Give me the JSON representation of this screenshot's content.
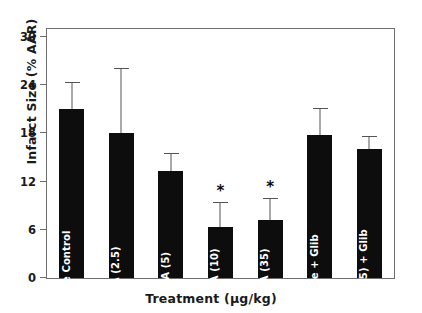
{
  "chart_data": {
    "type": "bar",
    "title": "",
    "xlabel": "Treatment (µg/kg)",
    "ylabel": "Infarct Size (% AAR)",
    "ylim": [
      0,
      31
    ],
    "yticks": [
      0,
      6,
      12,
      18,
      24,
      30
    ],
    "ytick_labels": [
      "0",
      "6",
      "12",
      "18",
      "24",
      "30"
    ],
    "grid": false,
    "legend": "none",
    "bar_color": "#0d0d0d",
    "error_color": "#555555",
    "categories": [
      "Vehicle Control",
      "MLA (2.5)",
      "MLA (5)",
      "MLA (10)",
      "MLA (35)",
      "Vehicle + Glib",
      "MLA (35) + Glib"
    ],
    "values": [
      21.0,
      18.1,
      13.3,
      6.3,
      7.2,
      17.8,
      16.1
    ],
    "errors": [
      3.4,
      8.0,
      2.3,
      3.2,
      2.8,
      3.4,
      1.6
    ],
    "error_tops": [
      24.4,
      26.1,
      15.6,
      9.5,
      10.0,
      21.2,
      17.7
    ],
    "significance": [
      "",
      "",
      "",
      "*",
      "*",
      "",
      ""
    ],
    "significance_marker": "*"
  }
}
